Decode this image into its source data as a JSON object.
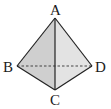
{
  "diagram": {
    "type": "tetrahedron",
    "vertices": {
      "A": {
        "label": "A",
        "x": 55,
        "y": 18
      },
      "B": {
        "label": "B",
        "x": 17,
        "y": 66
      },
      "C": {
        "label": "C",
        "x": 55,
        "y": 90
      },
      "D": {
        "label": "D",
        "x": 92,
        "y": 66
      }
    },
    "faces": [
      {
        "name": "ABC",
        "fill": "#cfcfcf"
      },
      {
        "name": "ACD",
        "fill": "#e3e3e3"
      }
    ],
    "edges": [
      {
        "from": "A",
        "to": "B",
        "style": "solid"
      },
      {
        "from": "A",
        "to": "C",
        "style": "solid"
      },
      {
        "from": "A",
        "to": "D",
        "style": "solid"
      },
      {
        "from": "B",
        "to": "C",
        "style": "solid"
      },
      {
        "from": "C",
        "to": "D",
        "style": "solid"
      },
      {
        "from": "B",
        "to": "D",
        "style": "dashed"
      }
    ],
    "colors": {
      "edge": "#222222",
      "hidden_edge": "#333333",
      "background": "#ffffff"
    }
  }
}
